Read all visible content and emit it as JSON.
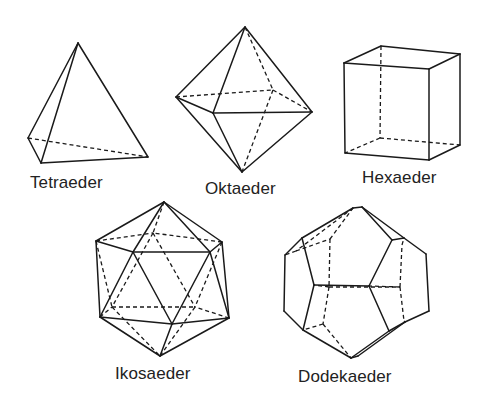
{
  "figure": {
    "colors": {
      "line": "#1a1a1a",
      "text": "#222222",
      "background": "#ffffff"
    },
    "solids": [
      {
        "id": "tetraeder",
        "label": "Tetraeder",
        "label_pos": [
          30,
          174
        ],
        "vertices": {
          "A": [
            78,
            43
          ],
          "L": [
            28,
            138
          ],
          "F": [
            41,
            163
          ],
          "R": [
            148,
            157
          ]
        },
        "solid_edges": [
          [
            "A",
            "L"
          ],
          [
            "A",
            "F"
          ],
          [
            "A",
            "R"
          ],
          [
            "L",
            "F"
          ],
          [
            "F",
            "R"
          ]
        ],
        "hidden_edges": [
          [
            "L",
            "R"
          ]
        ]
      },
      {
        "id": "oktaeder",
        "label": "Oktaeder",
        "label_pos": [
          205,
          180
        ],
        "vertices": {
          "T": [
            245,
            27
          ],
          "L": [
            176,
            97
          ],
          "F": [
            213,
            113
          ],
          "R": [
            312,
            112
          ],
          "B": [
            273,
            90
          ],
          "D": [
            242,
            172
          ]
        },
        "solid_edges": [
          [
            "T",
            "L"
          ],
          [
            "T",
            "F"
          ],
          [
            "T",
            "R"
          ],
          [
            "L",
            "F"
          ],
          [
            "F",
            "R"
          ],
          [
            "L",
            "D"
          ],
          [
            "F",
            "D"
          ],
          [
            "R",
            "D"
          ]
        ],
        "hidden_edges": [
          [
            "T",
            "B"
          ],
          [
            "L",
            "B"
          ],
          [
            "B",
            "R"
          ],
          [
            "B",
            "D"
          ]
        ]
      },
      {
        "id": "hexaeder",
        "label": "Hexaeder",
        "label_pos": [
          362,
          169
        ],
        "vertices": {
          "FTL": [
            344,
            63
          ],
          "FTR": [
            429,
            69
          ],
          "BTL": [
            381,
            46
          ],
          "BTR": [
            460,
            54
          ],
          "FBL": [
            345,
            153
          ],
          "FBR": [
            429,
            160
          ],
          "BBL": [
            380,
            138
          ],
          "BBR": [
            460,
            145
          ]
        },
        "solid_edges": [
          [
            "FTL",
            "FTR"
          ],
          [
            "FTR",
            "FBR"
          ],
          [
            "FBR",
            "FBL"
          ],
          [
            "FBL",
            "FTL"
          ],
          [
            "FTL",
            "BTL"
          ],
          [
            "BTL",
            "BTR"
          ],
          [
            "BTR",
            "FTR"
          ],
          [
            "BTR",
            "BBR"
          ],
          [
            "BBR",
            "FBR"
          ]
        ],
        "hidden_edges": [
          [
            "BTL",
            "BBL"
          ],
          [
            "BBL",
            "BBR"
          ],
          [
            "BBL",
            "FBL"
          ]
        ]
      },
      {
        "id": "ikosaeder",
        "label": "Ikosaeder",
        "label_pos": [
          115,
          365
        ],
        "vertices": {
          "T": [
            164,
            202
          ],
          "UL": [
            96,
            241
          ],
          "UR": [
            222,
            242
          ],
          "ML": [
            133,
            252
          ],
          "MR": [
            210,
            252
          ],
          "BU": [
            153,
            233
          ],
          "LL": [
            100,
            317
          ],
          "LR": [
            229,
            318
          ],
          "LM": [
            172,
            324
          ],
          "BT": [
            160,
            356
          ],
          "BLL": [
            112,
            307
          ],
          "BLR": [
            195,
            307
          ]
        },
        "solid_edges": [
          [
            "T",
            "UL"
          ],
          [
            "T",
            "ML"
          ],
          [
            "T",
            "MR"
          ],
          [
            "T",
            "UR"
          ],
          [
            "UL",
            "ML"
          ],
          [
            "ML",
            "MR"
          ],
          [
            "MR",
            "UR"
          ],
          [
            "UL",
            "LL"
          ],
          [
            "ML",
            "LL"
          ],
          [
            "ML",
            "LM"
          ],
          [
            "MR",
            "LM"
          ],
          [
            "MR",
            "LR"
          ],
          [
            "UR",
            "LR"
          ],
          [
            "LL",
            "LM"
          ],
          [
            "LM",
            "LR"
          ],
          [
            "LL",
            "BT"
          ],
          [
            "LM",
            "BT"
          ],
          [
            "LR",
            "BT"
          ]
        ],
        "hidden_edges": [
          [
            "T",
            "BU"
          ],
          [
            "UL",
            "BU"
          ],
          [
            "UR",
            "BU"
          ],
          [
            "BU",
            "BLL"
          ],
          [
            "BU",
            "BLR"
          ],
          [
            "UL",
            "BLL"
          ],
          [
            "UR",
            "BLR"
          ],
          [
            "BLL",
            "BLR"
          ],
          [
            "LL",
            "BLL"
          ],
          [
            "LR",
            "BLR"
          ],
          [
            "BLL",
            "BT"
          ],
          [
            "BLR",
            "BT"
          ]
        ]
      },
      {
        "id": "dodekaeder",
        "label": "Dodekaeder",
        "label_pos": [
          298,
          368
        ],
        "vertices": {
          "T1": [
            353,
            208
          ],
          "T2": [
            362,
            207
          ],
          "UL": [
            302,
            238
          ],
          "LT": [
            285,
            255
          ],
          "LB": [
            284,
            311
          ],
          "LL": [
            303,
            330
          ],
          "B1": [
            351,
            358
          ],
          "B2": [
            358,
            356
          ],
          "LR1": [
            389,
            331
          ],
          "LR2": [
            405,
            322
          ],
          "RB": [
            429,
            311
          ],
          "RT": [
            426,
            254
          ],
          "UR1": [
            392,
            240
          ],
          "UR2": [
            404,
            238
          ],
          "P1": [
            314,
            285
          ],
          "P2": [
            369,
            286
          ],
          "H1": [
            329,
            287
          ],
          "H2": [
            400,
            287
          ],
          "H3": [
            330,
            239
          ],
          "H4": [
            402,
            245
          ],
          "H5": [
            323,
            324
          ],
          "H6": [
            404,
            321
          ],
          "H7": [
            296,
            251
          ]
        },
        "solid_edges": [
          [
            "T1",
            "T2"
          ],
          [
            "T1",
            "UL"
          ],
          [
            "UL",
            "LT"
          ],
          [
            "LT",
            "LB"
          ],
          [
            "LB",
            "LL"
          ],
          [
            "LL",
            "B1"
          ],
          [
            "B1",
            "B2"
          ],
          [
            "B2",
            "LR2"
          ],
          [
            "B1",
            "LR1"
          ],
          [
            "LR1",
            "LR2"
          ],
          [
            "LR2",
            "RB"
          ],
          [
            "RB",
            "RT"
          ],
          [
            "RT",
            "UR2"
          ],
          [
            "UR2",
            "UR1"
          ],
          [
            "UR1",
            "T2"
          ],
          [
            "UR2",
            "T2"
          ],
          [
            "UL",
            "P1"
          ],
          [
            "P1",
            "P2"
          ],
          [
            "P2",
            "UR1"
          ],
          [
            "P1",
            "LL"
          ],
          [
            "P2",
            "LR1"
          ]
        ],
        "hidden_edges": [
          [
            "T1",
            "H7"
          ],
          [
            "H7",
            "LT"
          ],
          [
            "H3",
            "T1"
          ],
          [
            "H3",
            "H1"
          ],
          [
            "H1",
            "P1"
          ],
          [
            "H1",
            "H2"
          ],
          [
            "H2",
            "P2"
          ],
          [
            "H2",
            "H4"
          ],
          [
            "H4",
            "UR2"
          ],
          [
            "H1",
            "H5"
          ],
          [
            "H5",
            "LL"
          ],
          [
            "H5",
            "B1"
          ],
          [
            "H2",
            "H6"
          ],
          [
            "H6",
            "LR2"
          ],
          [
            "H7",
            "H3"
          ]
        ]
      }
    ]
  }
}
